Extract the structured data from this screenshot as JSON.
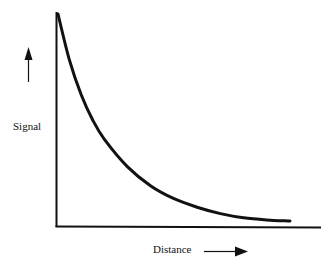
{
  "chart_data": {
    "type": "line",
    "title": "",
    "xlabel": "Distance",
    "ylabel": "Signal",
    "x": [
      0,
      0.05,
      0.1,
      0.15,
      0.2,
      0.3,
      0.4,
      0.5,
      0.6,
      0.7,
      0.8,
      0.9,
      1.0
    ],
    "series": [
      {
        "name": "Signal vs Distance",
        "values": [
          1.0,
          0.78,
          0.62,
          0.5,
          0.41,
          0.28,
          0.19,
          0.13,
          0.09,
          0.06,
          0.04,
          0.03,
          0.025
        ]
      }
    ],
    "xlim": [
      0,
      1.15
    ],
    "ylim": [
      0,
      1.05
    ],
    "grid": false,
    "legend": null,
    "ticks": "none",
    "annotations": [
      "up arrow beside Signal label",
      "right arrow beside Distance label"
    ],
    "note": "Qualitative exponential decay; no numeric ticks shown. Values are normalized, arbitrary units."
  },
  "labels": {
    "y_axis": "Signal",
    "x_axis": "Distance"
  },
  "colors": {
    "line": "#111111",
    "background": "#ffffff"
  }
}
